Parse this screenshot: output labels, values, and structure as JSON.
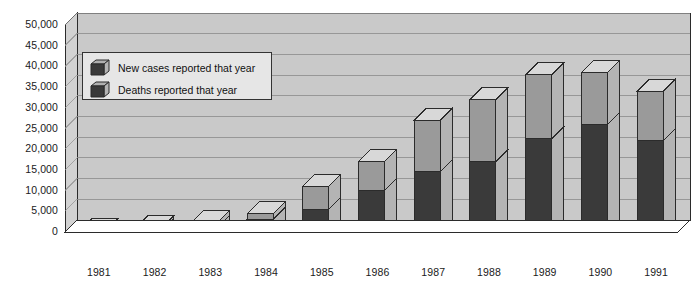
{
  "chart_data": {
    "type": "bar",
    "subtype": "stacked-3d-column",
    "title": "",
    "subtitle": "",
    "xlabel": "",
    "ylabel": "",
    "ylim": [
      0,
      50000
    ],
    "ytick_step": 5000,
    "grid": true,
    "legend_position": "top-left-inside",
    "categories": [
      "1981",
      "1982",
      "1983",
      "1984",
      "1985",
      "1986",
      "1987",
      "1988",
      "1989",
      "1990",
      "1991"
    ],
    "ytick_labels": [
      "0",
      "5,000",
      "10,000",
      "15,000",
      "20,000",
      "25,000",
      "30,000",
      "35,000",
      "40,000",
      "45,000",
      "50,000"
    ],
    "series": [
      {
        "name": "New cases reported that year",
        "color": "#8c8c8c",
        "values": [
          300,
          1000,
          2300,
          4400,
          11000,
          17000,
          27000,
          32000,
          38000,
          38500,
          34000
        ]
      },
      {
        "name": "Deaths reported that year",
        "color": "#3a3a3a",
        "values": [
          150,
          450,
          1100,
          3000,
          5500,
          10000,
          14500,
          17000,
          22500,
          26000,
          22000
        ]
      }
    ]
  },
  "legend": {
    "items": [
      {
        "label": "New cases reported that year",
        "swatch": "new-cases-swatch"
      },
      {
        "label": "Deaths reported that year",
        "swatch": "deaths-swatch"
      }
    ]
  },
  "colors": {
    "plot_background": "#c9c9c9",
    "wall_top": "#d2d2d2",
    "gridline": "#8f8f8f",
    "bar_front_cases": "#9a9a9a",
    "bar_front_deaths": "#3a3a3a",
    "bar_side": "#b4b4b4",
    "bar_top_light": "#d8d8d8",
    "bar_top_dark": "#b0b0b0",
    "outline": "#2b2b2b",
    "axis_text": "#1a1a1a",
    "page_background": "#ffffff",
    "legend_background": "#e6e6e6"
  }
}
